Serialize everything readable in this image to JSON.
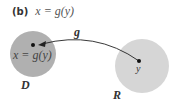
{
  "title": {
    "part": "(b)",
    "equation": "x = g(y)"
  },
  "labels": {
    "map": "g",
    "point_d": "x = g(y)",
    "point_r": "y",
    "domain": "D",
    "range": "R"
  },
  "colors": {
    "domain_fill": "#b0b0b0",
    "range_fill": "#d6d6d6",
    "arrow": "#222222"
  }
}
